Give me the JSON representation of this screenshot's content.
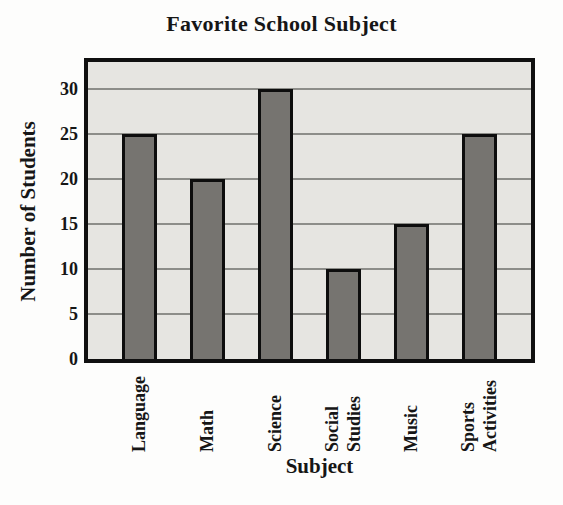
{
  "chart_data": {
    "type": "bar",
    "title": "Favorite School Subject",
    "xlabel": "Subject",
    "ylabel": "Number of Students",
    "categories": [
      [
        "Language"
      ],
      [
        "Math"
      ],
      [
        "Science"
      ],
      [
        "Social",
        "Studies"
      ],
      [
        "Music"
      ],
      [
        "Sports",
        "Activities"
      ]
    ],
    "values": [
      25,
      20,
      30,
      10,
      15,
      25
    ],
    "yticks": [
      0,
      5,
      10,
      15,
      20,
      25,
      30
    ],
    "ylim": [
      0,
      33
    ],
    "grid": true,
    "legend": "none",
    "colors": {
      "bar_fill": "#767470",
      "bar_border": "#0d0d0d",
      "plot_background": "#e6e5e1",
      "plot_border": "#101010",
      "gridline": "#8d8d89",
      "text": "#161616",
      "page_background": "#fdfdfc"
    }
  }
}
